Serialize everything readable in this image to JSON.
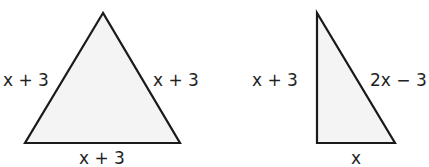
{
  "triangles": [
    {
      "name": "equilateral-triangle",
      "fill": "#f4f4f4",
      "stroke": "#1a1a1a",
      "labels": {
        "left": "x + 3",
        "right": "x + 3",
        "bottom": "x + 3"
      }
    },
    {
      "name": "right-triangle",
      "fill": "#f4f4f4",
      "stroke": "#1a1a1a",
      "labels": {
        "left": "x + 3",
        "hypotenuse": "2x − 3",
        "bottom": "x"
      }
    }
  ]
}
